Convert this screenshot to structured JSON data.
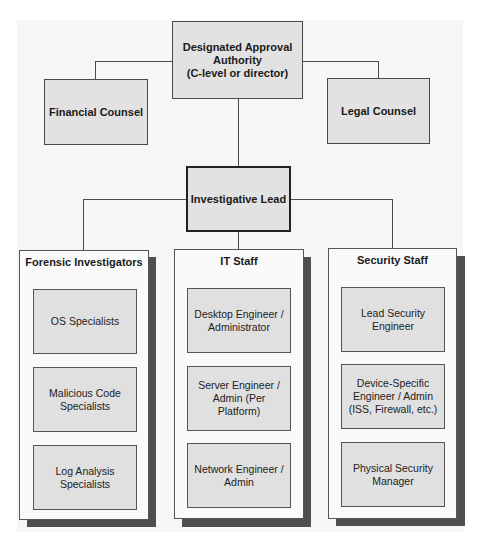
{
  "diagram": {
    "type": "org-chart",
    "top": {
      "approval_authority": "Designated Approval Authority (C-level or director)",
      "approval_authority_lines": [
        "Designated Approval",
        "Authority",
        "(C-level or director)"
      ],
      "financial_counsel": "Financial Counsel",
      "legal_counsel": "Legal Counsel"
    },
    "lead": "Investigative Lead",
    "columns": [
      {
        "title": "Forensic Investigators",
        "members": [
          "OS Specialists",
          "Malicious Code Specialists",
          "Log Analysis Specialists"
        ]
      },
      {
        "title": "IT Staff",
        "members": [
          "Desktop Engineer / Administrator",
          "Server Engineer / Admin (Per Platform)",
          "Network Engineer / Admin"
        ]
      },
      {
        "title": "Security Staff",
        "members": [
          "Lead Security Engineer",
          "Device-Specific Engineer / Admin (ISS, Firewall, etc.)",
          "Physical Security Manager"
        ]
      }
    ],
    "edges": [
      [
        "Designated Approval Authority (C-level or director)",
        "Financial Counsel"
      ],
      [
        "Designated Approval Authority (C-level or director)",
        "Legal Counsel"
      ],
      [
        "Designated Approval Authority (C-level or director)",
        "Investigative Lead"
      ],
      [
        "Investigative Lead",
        "Forensic Investigators"
      ],
      [
        "Investigative Lead",
        "IT Staff"
      ],
      [
        "Investigative Lead",
        "Security Staff"
      ]
    ],
    "colors": {
      "box_fill": "#e2e2e2",
      "panel_fill": "#fafafa",
      "shadow": "#4f4f4f",
      "line": "#4a4a4a"
    }
  }
}
